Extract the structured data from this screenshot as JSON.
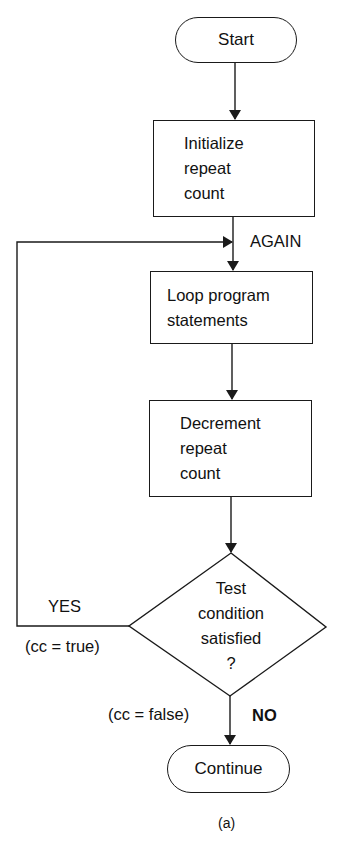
{
  "diagram": {
    "type": "flowchart",
    "caption": "(a)",
    "nodes": {
      "start": {
        "shape": "terminal",
        "label": "Start"
      },
      "init": {
        "shape": "process",
        "lines": [
          "Initialize",
          "repeat",
          "count"
        ]
      },
      "loop": {
        "shape": "process",
        "lines": [
          "Loop program",
          "statements"
        ]
      },
      "decrement": {
        "shape": "process",
        "lines": [
          "Decrement",
          "repeat",
          "count"
        ]
      },
      "test": {
        "shape": "decision",
        "lines": [
          "Test",
          "condition",
          "satisfied",
          "?"
        ]
      },
      "continue": {
        "shape": "terminal",
        "label": "Continue"
      }
    },
    "labels": {
      "again": "AGAIN",
      "yes": "YES",
      "yes_condition": "(cc = true)",
      "no": "NO",
      "no_condition": "(cc = false)"
    },
    "edges": [
      {
        "from": "start",
        "to": "init"
      },
      {
        "from": "init",
        "to": "loop",
        "label": "AGAIN"
      },
      {
        "from": "loop",
        "to": "decrement"
      },
      {
        "from": "decrement",
        "to": "test"
      },
      {
        "from": "test",
        "to": "loop",
        "label": "YES (cc = true)"
      },
      {
        "from": "test",
        "to": "continue",
        "label": "NO (cc = false)"
      }
    ],
    "colors": {
      "stroke": "#1a1a1a",
      "background": "#ffffff",
      "text": "#111111"
    }
  }
}
